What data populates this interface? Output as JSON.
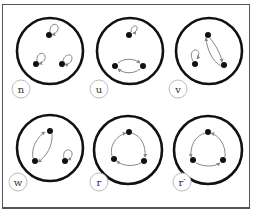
{
  "figure": {
    "colors": {
      "outer_circle": "#111111",
      "point": "#111111",
      "arrow": "#888888",
      "label_ring": "#bbbbbb",
      "frame": "#555555"
    },
    "panels": [
      {
        "id": "n",
        "label": "n",
        "row": 0,
        "col": 0,
        "description": "three fixed points (three loops)"
      },
      {
        "id": "u",
        "label": "u",
        "row": 0,
        "col": 1,
        "description": "one loop on top, two-cycle between bottom points"
      },
      {
        "id": "v",
        "label": "v",
        "row": 0,
        "col": 2,
        "description": "loop on left point, two-cycle between top and right"
      },
      {
        "id": "w",
        "label": "w",
        "row": 1,
        "col": 0,
        "description": "two-cycle between top and left, loop on right"
      },
      {
        "id": "r",
        "label": "r",
        "row": 1,
        "col": 1,
        "description": "three-cycle rotation"
      },
      {
        "id": "r-prime",
        "label": "r′",
        "row": 1,
        "col": 2,
        "description": "inverse three-cycle rotation"
      }
    ]
  }
}
